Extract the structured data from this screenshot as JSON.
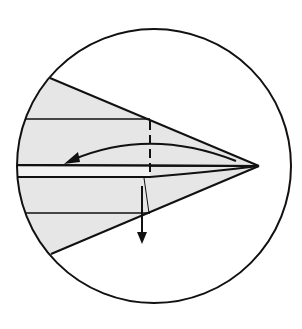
{
  "diagram": {
    "type": "origami-fold-step",
    "colors": {
      "background": "#ffffff",
      "paper_fill": "#e6e6e6",
      "line": "#111111"
    },
    "circle": {
      "cx": 154,
      "cy": 166,
      "r": 137
    },
    "paper_shape": {
      "points": "50,78 259,166 51,254"
    },
    "annotations": {
      "fold_arrow": "curved arrow pointing left (fold flap over)",
      "down_arrow": "arrow pointing down (pull out)",
      "valley_fold_line": "dashed vertical fold line"
    }
  }
}
